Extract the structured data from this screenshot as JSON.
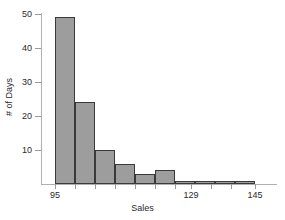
{
  "chart_data": {
    "type": "bar",
    "title": "",
    "subtitle": "",
    "xlabel": "Sales",
    "ylabel": "# of Days",
    "grid": false,
    "legend": null,
    "legend_position": "none",
    "bar_style": {
      "fill": "#9d9d9d",
      "border": "#3a3a3a",
      "axis": "#b0b0b0",
      "text": "#2a2a2a"
    },
    "xlim": [
      95,
      145
    ],
    "ylim": [
      0,
      50
    ],
    "bin_width": 5,
    "bin_edges": [
      95,
      100,
      105,
      110,
      115,
      120,
      125,
      130,
      135,
      140,
      145
    ],
    "categories": [
      "95-100",
      "100-105",
      "105-110",
      "110-115",
      "115-120",
      "120-125",
      "125-130",
      "130-135",
      "135-140",
      "140-145"
    ],
    "values": [
      49,
      24,
      10,
      6,
      3,
      4,
      1,
      1,
      1,
      1
    ],
    "x_ticks": [
      {
        "value": 95,
        "label": "95",
        "labeled": true
      },
      {
        "value": 100,
        "label": "",
        "labeled": false
      },
      {
        "value": 105,
        "label": "",
        "labeled": false
      },
      {
        "value": 110,
        "label": "",
        "labeled": false
      },
      {
        "value": 115,
        "label": "",
        "labeled": false
      },
      {
        "value": 120,
        "label": "",
        "labeled": false
      },
      {
        "value": 125,
        "label": "",
        "labeled": false
      },
      {
        "value": 129,
        "label": "129",
        "labeled": true
      },
      {
        "value": 134,
        "label": "",
        "labeled": false
      },
      {
        "value": 139,
        "label": "",
        "labeled": false
      },
      {
        "value": 145,
        "label": "145",
        "labeled": true
      }
    ],
    "y_ticks": [
      {
        "value": 10,
        "label": "10"
      },
      {
        "value": 20,
        "label": "20"
      },
      {
        "value": 30,
        "label": "30"
      },
      {
        "value": 40,
        "label": "40"
      },
      {
        "value": 50,
        "label": "50"
      }
    ]
  }
}
